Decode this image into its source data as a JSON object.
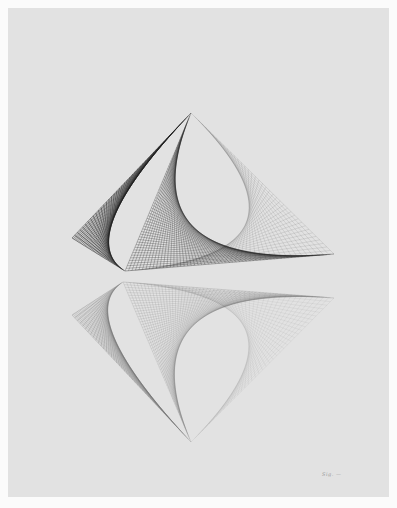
{
  "artwork": {
    "description": "Photograph of a string-art / line drawing: a concave pyramid-like form with a mirrored reflection beneath it",
    "background_color": "#e2e2e2",
    "border_color": "#fbfbfb",
    "upper_form": {
      "apex": [
        191,
        113
      ],
      "left_tip": [
        72,
        238
      ],
      "front_tip": [
        125,
        271
      ],
      "right_tip": [
        334,
        254
      ],
      "line_color": "#1e1e1e"
    },
    "lower_reflection": {
      "apex": [
        191,
        442
      ],
      "left_tip": [
        72,
        315
      ],
      "back_tip": [
        123,
        282
      ],
      "right_tip": [
        334,
        298
      ],
      "line_color": "#6a6a6a"
    },
    "signature": "Sig. —"
  }
}
